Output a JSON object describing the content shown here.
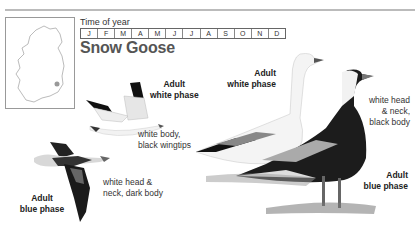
{
  "header": {
    "time_of_year_label": "Time of year",
    "months": [
      "J",
      "F",
      "M",
      "A",
      "M",
      "J",
      "J",
      "A",
      "S",
      "O",
      "N",
      "D"
    ],
    "species_name": "Snow Goose"
  },
  "map": {
    "region": "Ireland",
    "marker": "south-east coast"
  },
  "labels": {
    "flying_white_title": "Adult\nwhite phase",
    "flying_white_title_l1": "Adult",
    "flying_white_title_l2": "white phase",
    "flying_white_desc_l1": "white body,",
    "flying_white_desc_l2": "black wingtips",
    "flying_blue_title_l1": "Adult",
    "flying_blue_title_l2": "blue phase",
    "flying_blue_desc_l1": "white head &",
    "flying_blue_desc_l2": "neck, dark body",
    "standing_white_title_l1": "Adult",
    "standing_white_title_l2": "white phase",
    "standing_blue_desc_l1": "white head",
    "standing_blue_desc_l2": "& neck,",
    "standing_blue_desc_l3": "black body",
    "standing_blue_title_l1": "Adult",
    "standing_blue_title_l2": "blue phase"
  }
}
